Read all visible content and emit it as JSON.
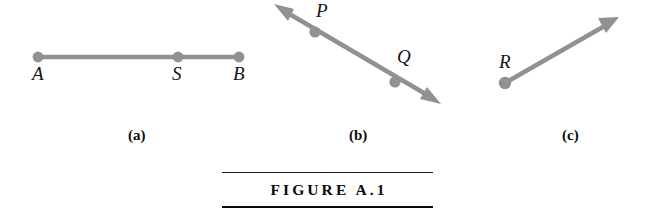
{
  "figure": {
    "title": "FIGURE A.1",
    "canvas": {
      "width": 649,
      "height": 220,
      "background": "#ffffff"
    },
    "stroke_color": "#919191",
    "text_color": "#141414",
    "rule_color": "#0a0a0a"
  },
  "panels": [
    {
      "caption": "(a)",
      "kind": "segment",
      "description": "line segment AB with interior point S",
      "points": [
        {
          "label": "A",
          "x": 38,
          "y": 57
        },
        {
          "label": "S",
          "x": 178,
          "y": 57
        },
        {
          "label": "B",
          "x": 239,
          "y": 57
        }
      ],
      "arrowheads": "none"
    },
    {
      "caption": "(b)",
      "kind": "line",
      "description": "line through P and Q with arrowheads at both ends",
      "points": [
        {
          "label": "P",
          "x": 315,
          "y": 32
        },
        {
          "label": "Q",
          "x": 395,
          "y": 82
        }
      ],
      "arrowheads": "both",
      "endpoints": [
        {
          "x": 275,
          "y": 5
        },
        {
          "x": 440,
          "y": 103
        }
      ]
    },
    {
      "caption": "(c)",
      "kind": "ray",
      "description": "ray starting at R with one arrowhead",
      "points": [
        {
          "label": "R",
          "x": 505,
          "y": 83
        }
      ],
      "arrowheads": "one",
      "endpoints": [
        {
          "x": 505,
          "y": 83
        },
        {
          "x": 618,
          "y": 18
        }
      ]
    }
  ],
  "labels": {
    "A": "A",
    "S": "S",
    "B": "B",
    "P": "P",
    "Q": "Q",
    "R": "R"
  },
  "captions": {
    "a": "(a)",
    "b": "(b)",
    "c": "(c)"
  }
}
